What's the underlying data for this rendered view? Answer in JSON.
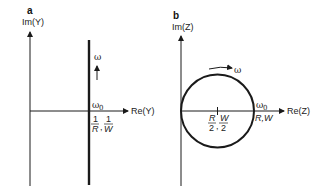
{
  "panels": [
    {
      "id": "a",
      "label": "a",
      "y_axis_label": "Im(Y)",
      "x_axis_label": "Re(Y)",
      "curve_label": "ω",
      "reference_label": "ω",
      "reference_sub": "0",
      "intercept_label_left_num": "1",
      "intercept_label_left_den": "R",
      "intercept_label_sep": ",",
      "intercept_label_right_num": "1",
      "intercept_label_right_den": "W"
    },
    {
      "id": "b",
      "label": "b",
      "y_axis_label": "Im(Z)",
      "x_axis_label": "Re(Z)",
      "curve_label": "ω",
      "reference_label": "ω",
      "reference_sub": "0",
      "center_label_left_num": "R",
      "center_label_left_den": "2",
      "center_label_sep": ",",
      "center_label_right_num": "W",
      "center_label_right_den": "2",
      "intercept_label": "R,W"
    }
  ],
  "colors": {
    "stroke": "#1a1a1a",
    "background": "#ffffff"
  }
}
